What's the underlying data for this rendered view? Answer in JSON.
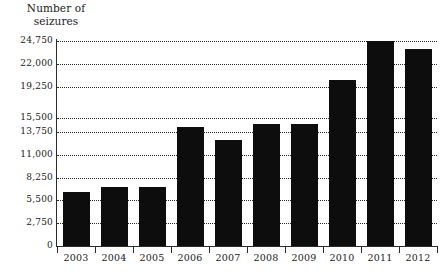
{
  "chart_data": {
    "type": "bar",
    "title": "Number of\nseizures",
    "xlabel": "",
    "ylabel": "Number of seizures",
    "categories": [
      "2003",
      "2004",
      "2005",
      "2006",
      "2007",
      "2008",
      "2009",
      "2010",
      "2011",
      "2012"
    ],
    "values": [
      6500,
      7100,
      7100,
      14350,
      12800,
      14700,
      14700,
      20000,
      24750,
      23800
    ],
    "series": [
      {
        "name": "Number of seizures",
        "values": [
          6500,
          7100,
          7100,
          14350,
          12800,
          14700,
          14700,
          20000,
          24750,
          23800
        ]
      }
    ],
    "ytick_labels": [
      "0",
      "2,750",
      "5,500",
      "8,250",
      "11,000",
      "13,750",
      "15,500",
      "19,250",
      "22,000",
      "24,750"
    ],
    "ytick_values": [
      0,
      2750,
      5500,
      8250,
      11000,
      13750,
      15500,
      19250,
      22000,
      24750
    ],
    "ylim": [
      0,
      24750
    ],
    "grid": true,
    "grid_style": "dotted",
    "legend": "none",
    "bar_color": "#0d0d0d",
    "axis_color": "#2b2b2b",
    "background_color": "#ffffff"
  }
}
